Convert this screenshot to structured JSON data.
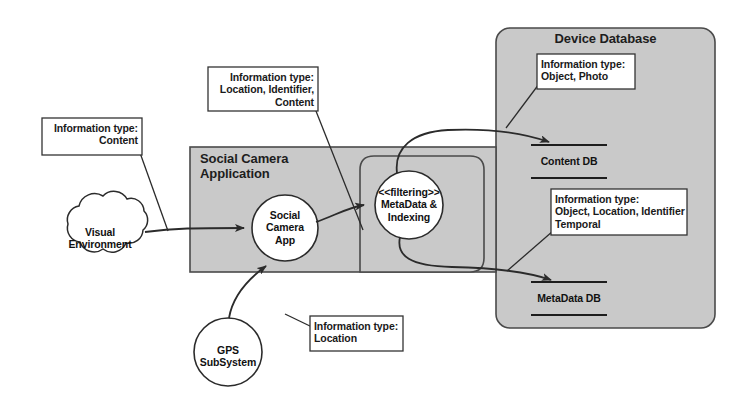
{
  "diagram": {
    "colors": {
      "container_fill": "#c9c9c9",
      "container_stroke": "#4a4a4a",
      "note_fill": "#ffffff",
      "note_stroke": "#333333",
      "node_fill": "#ffffff",
      "node_stroke": "#2b2b2b",
      "flow_stroke": "#2b2b2b",
      "page_background": "#ffffff"
    },
    "containers": [
      {
        "id": "social-camera-application",
        "label": "Social Camera\nApplication",
        "shape": "rectangle",
        "fill": "#c9c9c9"
      },
      {
        "id": "device-database",
        "label": "Device Database",
        "shape": "rounded-rectangle",
        "fill": "#c9c9c9"
      },
      {
        "id": "filtering-subsystem-boundary",
        "label": "",
        "shape": "rounded-rectangle",
        "fill": "#c9c9c9"
      }
    ],
    "nodes": [
      {
        "id": "visual-environment",
        "label": "Visual\nEnvironment",
        "shape": "cloud"
      },
      {
        "id": "social-camera-app",
        "label": "Social\nCamera\nApp",
        "shape": "circle"
      },
      {
        "id": "metadata-indexing",
        "label": "<<filtering>>\nMetaData &\nIndexing",
        "shape": "circle"
      },
      {
        "id": "gps-subsystem",
        "label": "GPS\nSubSystem",
        "shape": "circle"
      }
    ],
    "datastores": [
      {
        "id": "content-db",
        "label": "Content DB"
      },
      {
        "id": "metadata-db",
        "label": "MetaData DB"
      }
    ],
    "notes": [
      {
        "id": "note-content",
        "align": "right",
        "lines": [
          "Information type:",
          "Content"
        ],
        "text": "Information type:\nContent"
      },
      {
        "id": "note-location-identifier-content",
        "align": "right",
        "lines": [
          "Information type:",
          "Location, Identifier,",
          "Content"
        ],
        "text": "Information type:\nLocation, Identifier,\nContent"
      },
      {
        "id": "note-object-photo",
        "align": "left",
        "lines": [
          "Information type:",
          "Object, Photo"
        ],
        "text": "Information type:\nObject, Photo"
      },
      {
        "id": "note-object-location-identifier-temporal",
        "align": "left",
        "lines": [
          "Information type:",
          "Object, Location, Identifier",
          "Temporal"
        ],
        "text": "Information type:\nObject, Location, Identifier\nTemporal"
      },
      {
        "id": "note-location",
        "align": "left",
        "lines": [
          "Information type:",
          "Location"
        ],
        "text": "Information type:\nLocation"
      }
    ],
    "flows": [
      {
        "id": "flow-environment-to-app",
        "from": "visual-environment",
        "to": "social-camera-app"
      },
      {
        "id": "flow-gps-to-app",
        "from": "gps-subsystem",
        "to": "social-camera-app"
      },
      {
        "id": "flow-app-to-filtering",
        "from": "social-camera-app",
        "to": "metadata-indexing"
      },
      {
        "id": "flow-filtering-to-content-db",
        "from": "metadata-indexing",
        "to": "content-db"
      },
      {
        "id": "flow-filtering-to-metadata-db",
        "from": "metadata-indexing",
        "to": "metadata-db"
      }
    ]
  }
}
